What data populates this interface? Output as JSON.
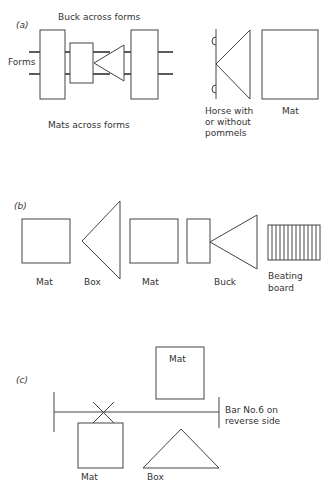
{
  "figure": {
    "panels": [
      {
        "label": "(a)",
        "texts": {
          "buck_across_forms": "Buck across forms",
          "forms": "Forms",
          "mats_across_forms": "Mats across forms",
          "horse_line1": "Horse with",
          "horse_line2": "or without",
          "horse_line3": "pommels",
          "mat": "Mat"
        }
      },
      {
        "label": "(b)",
        "texts": {
          "mat1": "Mat",
          "box": "Box",
          "mat2": "Mat",
          "buck": "Buck",
          "beating_line1": "Beating",
          "beating_line2": "board"
        }
      },
      {
        "label": "(c)",
        "texts": {
          "mat_top": "Mat",
          "bar_line1": "Bar No.6 on",
          "bar_line2": "reverse side",
          "mat_bottom": "Mat",
          "box": "Box"
        }
      }
    ],
    "colors": {
      "line": "#444444",
      "text": "#333333",
      "background": "#ffffff"
    }
  }
}
